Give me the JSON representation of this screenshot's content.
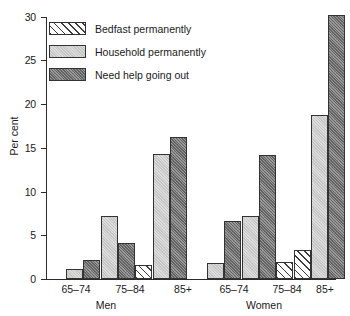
{
  "chart_data": {
    "type": "bar",
    "title": "",
    "subtitle": "",
    "xlabel": "",
    "ylabel": "Per cent",
    "ylim": [
      0,
      30
    ],
    "yticks": [
      0,
      5,
      10,
      15,
      20,
      25,
      30
    ],
    "grid": false,
    "legend_position": "top-left",
    "panels": [
      {
        "name": "Men",
        "categories": [
          "65–74",
          "75–84",
          "85+"
        ]
      },
      {
        "name": "Women",
        "categories": [
          "65–74",
          "75–84",
          "85+"
        ]
      }
    ],
    "categories": [
      "Men 65–74",
      "Men 75–84",
      "Men 85+",
      "Women 65–74",
      "Women 75–84",
      "Women 85+"
    ],
    "series": [
      {
        "name": "Bedfast  permanently",
        "pattern": "diagonal-hatch",
        "color": "#ffffff",
        "values": [
          0.0,
          1.6,
          0.0,
          0.0,
          2.0,
          3.3
        ]
      },
      {
        "name": "Household permanently",
        "pattern": "light-stipple",
        "color": "#dcdcdc",
        "values": [
          1.2,
          7.2,
          14.4,
          1.8,
          7.2,
          18.8
        ]
      },
      {
        "name": "Need help going out",
        "pattern": "dark-stipple",
        "color": "#8d8d8d",
        "values": [
          2.2,
          4.1,
          16.3,
          6.7,
          14.2,
          30.4
        ]
      }
    ]
  },
  "legend": {
    "items": [
      {
        "label": "Bedfast  permanently"
      },
      {
        "label": "Household permanently"
      },
      {
        "label": "Need help going out"
      }
    ]
  },
  "axes": {
    "y_title": "Per cent",
    "y_tick_labels": [
      "0",
      "5",
      "10",
      "15",
      "20",
      "25",
      "30"
    ]
  },
  "groups": [
    {
      "label": "65–74"
    },
    {
      "label": "75–84"
    },
    {
      "label": "85+"
    },
    {
      "label": "65–74"
    },
    {
      "label": "75–84"
    },
    {
      "label": "85+"
    }
  ],
  "panel_labels": [
    {
      "label": "Men"
    },
    {
      "label": "Women"
    }
  ]
}
